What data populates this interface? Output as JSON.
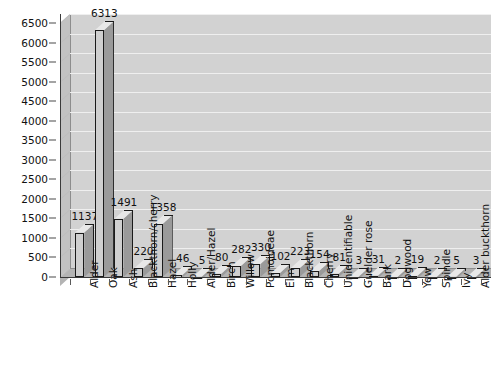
{
  "chart_data": {
    "type": "bar",
    "title": "",
    "subtitle": "",
    "xlabel": "",
    "ylabel": "",
    "ylim": [
      0,
      6500
    ],
    "ytick_step": 500,
    "grid": true,
    "legend": "none",
    "three_d": true,
    "yticks": [
      "0",
      "500",
      "1000",
      "1500",
      "2000",
      "2500",
      "3000",
      "3500",
      "4000",
      "4500",
      "5000",
      "5500",
      "6000",
      "6500"
    ],
    "categories": [
      "Alder",
      "Oak",
      "Ash",
      "Blackthorn/cherry",
      "Hazel",
      "Holly",
      "Alder/Hazel",
      "Birch",
      "Willow",
      "Pomoideae",
      "Elm",
      "Blackthorn",
      "Cherry",
      "Unidentifiable",
      "Guelder rose",
      "Bark",
      "Dogwood",
      "Yew",
      "Spindle",
      "Ivy",
      "Alder buckthorn"
    ],
    "values": [
      1137,
      6313,
      1491,
      220,
      1358,
      46,
      5,
      80,
      282,
      330,
      102,
      223,
      154,
      81,
      3,
      31,
      2,
      19,
      2,
      5,
      3
    ],
    "value_labels": [
      "1137",
      "6313",
      "1491",
      "220",
      "1358",
      "46",
      "5",
      "80",
      "282",
      "330",
      "102",
      "223",
      "154",
      "81",
      "3",
      "31",
      "2",
      "19",
      "2",
      "5",
      "3"
    ],
    "colors": {
      "bar_front": "#cfcfcf",
      "bar_top": "#e8e8e8",
      "bar_side": "#9a9a9a",
      "bar_outline": "#1a1a1a",
      "plot_background": "#d2d2d2",
      "plot_side": "#c2c2c2",
      "plot_floor": "#b4b4b4",
      "gridline": "#efefef",
      "axis": "#3a3a3a",
      "text": "#111111",
      "page_background": "#ffffff"
    }
  }
}
